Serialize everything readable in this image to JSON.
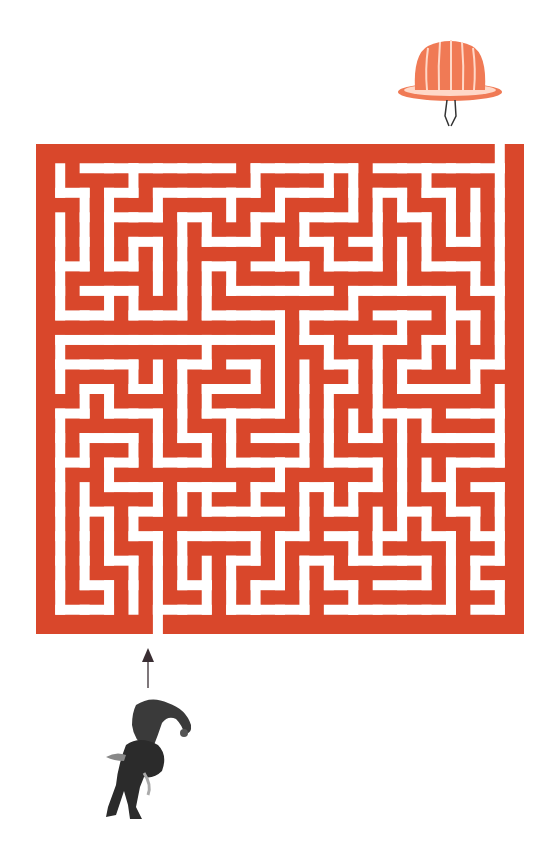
{
  "puzzle": {
    "type": "maze",
    "goal_label": "jelly-mold",
    "start_label": "elephant-headed-figure",
    "direction_hint": "up"
  },
  "colors": {
    "maze_wall": "#D9472B",
    "maze_path": "#FFFFFF",
    "jelly": "#F07A55",
    "jelly_highlight": "#FFD8C8",
    "figure": "#2B2B2B",
    "arrow": "#3A2E33",
    "background": "#FFFFFF"
  },
  "maze": {
    "cols": 19,
    "rows": 19,
    "seed": 7,
    "entrance_col": 4,
    "exit_col": 18
  }
}
